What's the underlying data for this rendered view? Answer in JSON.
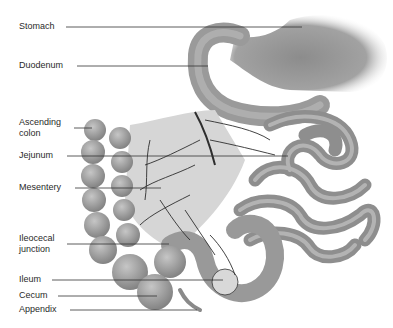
{
  "diagram": {
    "labels": [
      {
        "id": "stomach",
        "text": "Stomach",
        "x": 19,
        "y": 21,
        "line": {
          "x1": 66,
          "y1": 27,
          "x2": 302,
          "y2": 27
        }
      },
      {
        "id": "duodenum",
        "text": "Duodenum",
        "x": 19,
        "y": 60,
        "line": {
          "x1": 77,
          "y1": 66,
          "x2": 208,
          "y2": 66
        }
      },
      {
        "id": "ascending-colon",
        "text": "Ascending\ncolon",
        "x": 19,
        "y": 117,
        "line": {
          "x1": 74,
          "y1": 128,
          "x2": 92,
          "y2": 128
        }
      },
      {
        "id": "jejunum",
        "text": "Jejunum",
        "x": 19,
        "y": 150,
        "line": {
          "x1": 67,
          "y1": 156,
          "x2": 288,
          "y2": 156
        }
      },
      {
        "id": "mesentery",
        "text": "Mesentery",
        "x": 19,
        "y": 182,
        "line": {
          "x1": 75,
          "y1": 188,
          "x2": 161,
          "y2": 188
        }
      },
      {
        "id": "ileocecal-junction",
        "text": "Ileocecal\njunction",
        "x": 19,
        "y": 233,
        "line": {
          "x1": 67,
          "y1": 244,
          "x2": 169,
          "y2": 244
        }
      },
      {
        "id": "ileum",
        "text": "Ileum",
        "x": 19,
        "y": 274,
        "line": {
          "x1": 52,
          "y1": 280,
          "x2": 223,
          "y2": 280
        }
      },
      {
        "id": "cecum",
        "text": "Cecum",
        "x": 19,
        "y": 290,
        "line": {
          "x1": 58,
          "y1": 296,
          "x2": 157,
          "y2": 296
        }
      },
      {
        "id": "appendix",
        "text": "Appendix",
        "x": 19,
        "y": 304,
        "line": {
          "x1": 70,
          "y1": 310,
          "x2": 197,
          "y2": 310
        }
      }
    ],
    "colors": {
      "text": "#2a2a2a",
      "leader_line": "#333333",
      "organ_dark": "#8a8a8a",
      "organ_mid": "#a8a8a8",
      "organ_light": "#d0d0d0",
      "vessel": "#2e2e2e"
    }
  }
}
